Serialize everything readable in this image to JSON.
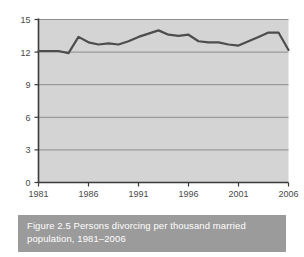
{
  "figure": {
    "caption": "Figure 2.5 Persons divorcing per thousand married population, 1981–2006",
    "caption_bar_color": "#9b9b9b",
    "caption_text_color": "#ffffff",
    "background_color": "#ffffff"
  },
  "chart_data": {
    "type": "line",
    "title": "",
    "subtitle": "",
    "xlabel": "",
    "ylabel": "",
    "xlim": [
      1981,
      2006
    ],
    "ylim": [
      0,
      15
    ],
    "ytick_labels": [
      "0",
      "3",
      "6",
      "9",
      "12",
      "15"
    ],
    "ytick_values": [
      0,
      3,
      6,
      9,
      12,
      15
    ],
    "xtick_labels": [
      "1981",
      "1986",
      "1991",
      "1996",
      "2001",
      "2006"
    ],
    "xtick_values": [
      1981,
      1986,
      1991,
      1996,
      2001,
      2006
    ],
    "grid": true,
    "grid_orientation": "horizontal",
    "legend": false,
    "legend_position": "none",
    "plot_bg_color": "#d4d4d4",
    "line_color": "#4d4d4d",
    "grid_color": "#8c8c8c",
    "axis_color": "#3a3a3a",
    "series": [
      {
        "name": "Persons divorcing per thousand married population",
        "x": [
          1981,
          1982,
          1983,
          1984,
          1985,
          1986,
          1987,
          1988,
          1989,
          1990,
          1991,
          1992,
          1993,
          1994,
          1995,
          1996,
          1997,
          1998,
          1999,
          2000,
          2001,
          2002,
          2003,
          2004,
          2005,
          2006
        ],
        "values": [
          12.1,
          12.1,
          12.1,
          11.9,
          13.4,
          12.9,
          12.7,
          12.8,
          12.7,
          13.0,
          13.4,
          13.7,
          14.0,
          13.6,
          13.5,
          13.6,
          13.0,
          12.9,
          12.9,
          12.7,
          12.6,
          13.0,
          13.4,
          13.8,
          13.8,
          12.2
        ]
      }
    ],
    "annotations": []
  }
}
